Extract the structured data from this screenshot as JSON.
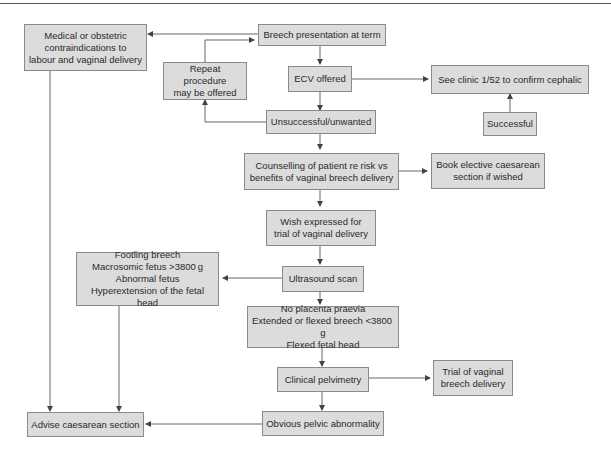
{
  "header": {
    "text": "7 Malpresentation"
  },
  "nodes": {
    "breech": "Breech presentation at term",
    "contra": "Medical or obstetric\ncontraindications to\nlabour and vaginal delivery",
    "repeat": "Repeat procedure\nmay be offered",
    "ecv": "ECV offered",
    "clinic": "See clinic 1/52 to confirm cephalic",
    "successful": "Successful",
    "unsuccessful": "Unsuccessful/unwanted",
    "counselling": "Counselling of patient re risk vs\nbenefits of vaginal breech delivery",
    "book": "Book elective caesarean\nsection if wished",
    "wish": "Wish expressed for\ntrial of vaginal delivery",
    "ultrasound": "Ultrasound scan",
    "footling": "Footling breech\nMacrosomic fetus >3800 g\nAbnormal fetus\nHyperextension of the fetal head",
    "noplacenta": "No placenta praevia\nExtended or flexed breech <3800 g\nFlexed fetal head",
    "pelvimetry": "Clinical pelvimetry",
    "trial": "Trial of vaginal\nbreech delivery",
    "obvious": "Obvious pelvic abnormality",
    "advise": "Advise caesarean section"
  },
  "colors": {
    "node_fill": "#dcdcdc",
    "node_border": "#8a8a8a",
    "edge": "#555555"
  }
}
